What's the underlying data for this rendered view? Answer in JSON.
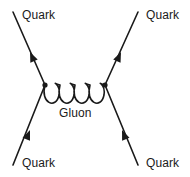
{
  "diagram": {
    "type": "feynman-diagram",
    "background_color": "#ffffff",
    "line_color": "#1a1a1a",
    "text_color": "#1a1a1a",
    "canvas": {
      "width": 190,
      "height": 177
    },
    "vertices": [
      {
        "name": "left-vertex",
        "x": 45,
        "y": 85
      },
      {
        "name": "right-vertex",
        "x": 105,
        "y": 85
      }
    ],
    "fermion_lines": [
      {
        "name": "incoming-quark-lower-left",
        "label": "Quark",
        "from": {
          "x": 13,
          "y": 165
        },
        "to": {
          "x": 45,
          "y": 85
        },
        "arrow_at": {
          "x": 30,
          "y": 130
        },
        "arrow_direction": "up-right"
      },
      {
        "name": "outgoing-quark-upper-left",
        "label": "Quark",
        "from": {
          "x": 45,
          "y": 85
        },
        "to": {
          "x": 13,
          "y": 12
        },
        "arrow_at": {
          "x": 30,
          "y": 52
        },
        "arrow_direction": "up-left"
      },
      {
        "name": "incoming-quark-lower-right",
        "label": "Quark",
        "from": {
          "x": 138,
          "y": 165
        },
        "to": {
          "x": 105,
          "y": 85
        },
        "arrow_at": {
          "x": 122,
          "y": 130
        },
        "arrow_direction": "up-left"
      },
      {
        "name": "outgoing-quark-upper-right",
        "label": "Quark",
        "from": {
          "x": 105,
          "y": 85
        },
        "to": {
          "x": 138,
          "y": 12
        },
        "arrow_at": {
          "x": 121,
          "y": 52
        },
        "arrow_direction": "up-right"
      }
    ],
    "gluon": {
      "label": "Gluon",
      "loops": 4,
      "from": {
        "x": 45,
        "y": 85
      },
      "to": {
        "x": 105,
        "y": 85
      },
      "loop_depth": 22
    },
    "labels": {
      "quark_top_left": "Quark",
      "quark_top_right": "Quark",
      "quark_bottom_left": "Quark",
      "quark_bottom_right": "Quark",
      "gluon": "Gluon"
    }
  }
}
